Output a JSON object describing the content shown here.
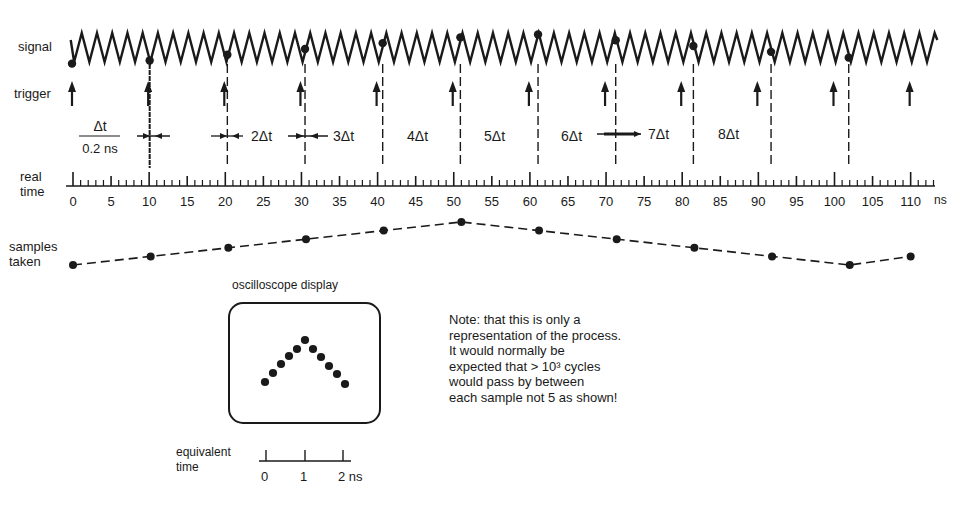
{
  "labels": {
    "signal": "signal",
    "trigger": "trigger",
    "real_time_line1": "real",
    "real_time_line2": "time",
    "samples_line1": "samples",
    "samples_line2": "taken",
    "dt_numerator": "Δt",
    "dt_denominator": "0.2 ns",
    "oscilloscope_title": "oscilloscope display",
    "equivalent_time_line1": "equivalent",
    "equivalent_time_line2": "time",
    "time_unit": "ns"
  },
  "delta_labels": [
    "2Δt",
    "3Δt",
    "4Δt",
    "5Δt",
    "6Δt",
    "7Δt",
    "8Δt"
  ],
  "note": {
    "lines": [
      "Note: that this is only a",
      "representation of the process.",
      "It would normally be",
      "expected that > 10³ cycles",
      "would pass by between",
      "each sample not 5 as shown!"
    ]
  },
  "real_time_axis": {
    "min": 0,
    "max": 110,
    "major_step": 5,
    "minor_step": 1,
    "tick_labels": [
      "0",
      "5",
      "10",
      "15",
      "20",
      "25",
      "30",
      "35",
      "40",
      "45",
      "50",
      "55",
      "60",
      "65",
      "70",
      "75",
      "80",
      "85",
      "90",
      "95",
      "100",
      "105",
      "110"
    ]
  },
  "signal": {
    "type": "triangle-wave",
    "period_ns": 2,
    "start_ns": -0.3,
    "end_ns": 113.5
  },
  "trigger_times_ns": [
    0,
    10,
    20,
    30,
    40,
    50,
    60,
    70,
    80,
    90,
    100,
    110
  ],
  "sample_times_ns": [
    0,
    10.2,
    20.4,
    30.6,
    40.8,
    51.0,
    61.2,
    71.4,
    81.6,
    91.8,
    102.0
  ],
  "samples_taken": {
    "points": [
      {
        "t": 0,
        "level": 0
      },
      {
        "t": 10.2,
        "level": 1
      },
      {
        "t": 20.4,
        "level": 2
      },
      {
        "t": 30.6,
        "level": 3
      },
      {
        "t": 40.8,
        "level": 4
      },
      {
        "t": 51.0,
        "level": 5
      },
      {
        "t": 61.2,
        "level": 4
      },
      {
        "t": 71.4,
        "level": 3
      },
      {
        "t": 81.6,
        "level": 2
      },
      {
        "t": 91.8,
        "level": 1
      },
      {
        "t": 102.0,
        "level": 0
      },
      {
        "t": 110.0,
        "level": 1
      }
    ]
  },
  "oscilloscope": {
    "dots": [
      [
        265,
        382
      ],
      [
        273,
        373
      ],
      [
        281,
        364
      ],
      [
        289,
        356
      ],
      [
        297,
        349
      ],
      [
        305,
        340
      ],
      [
        313,
        349
      ],
      [
        321,
        357
      ],
      [
        329,
        366
      ],
      [
        337,
        374
      ],
      [
        345,
        384
      ]
    ]
  },
  "equivalent_time_axis": {
    "tick_labels": [
      "0",
      "1",
      "2 ns"
    ]
  }
}
